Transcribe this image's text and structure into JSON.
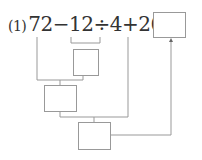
{
  "problem": {
    "label": "(1)",
    "expression": "72−12÷4+26=",
    "tokens": [
      "72",
      "−",
      "12",
      "÷",
      "4",
      "+",
      "26",
      "="
    ]
  },
  "boxes": {
    "answer": "",
    "step1": "",
    "step2": "",
    "step3": ""
  },
  "colors": {
    "line": "#999999",
    "text": "#333333"
  }
}
